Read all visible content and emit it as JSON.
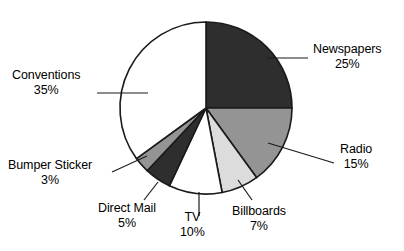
{
  "chart_data": {
    "type": "pie",
    "title": "",
    "subtitle": "",
    "xlabel": "",
    "ylabel": "",
    "legend_position": "none",
    "grid": false,
    "labels_shown": "outside-with-leader-lines",
    "total": 100,
    "units": "%",
    "start_angle_deg": 0,
    "direction": "clockwise",
    "categories": [
      "Newspapers",
      "Radio",
      "Billboards",
      "TV",
      "Direct Mail",
      "Bumper Sticker",
      "Conventions"
    ],
    "values": [
      25,
      15,
      7,
      10,
      5,
      3,
      35
    ],
    "slices": [
      {
        "name": "Newspapers",
        "value": 25,
        "value_label": "25%",
        "color": "#2e2e2e",
        "start_deg": 0,
        "end_deg": 90
      },
      {
        "name": "Radio",
        "value": 15,
        "value_label": "15%",
        "color": "#949494",
        "start_deg": 90,
        "end_deg": 144
      },
      {
        "name": "Billboards",
        "value": 7,
        "value_label": "7%",
        "color": "#dcdcdc",
        "start_deg": 144,
        "end_deg": 169.2
      },
      {
        "name": "TV",
        "value": 10,
        "value_label": "10%",
        "color": "#ffffff",
        "start_deg": 169.2,
        "end_deg": 205.2
      },
      {
        "name": "Direct Mail",
        "value": 5,
        "value_label": "5%",
        "color": "#2e2e2e",
        "start_deg": 205.2,
        "end_deg": 223.2
      },
      {
        "name": "Bumper Sticker",
        "value": 3,
        "value_label": "3%",
        "color": "#949494",
        "start_deg": 223.2,
        "end_deg": 234
      },
      {
        "name": "Conventions",
        "value": 35,
        "value_label": "35%",
        "color": "#ffffff",
        "start_deg": 234,
        "end_deg": 360
      }
    ]
  },
  "colors": {
    "background": "#ffffff",
    "outline": "#1a1a1a",
    "text": "#000000",
    "dark_slice": "#2e2e2e",
    "mid_gray_slice": "#949494",
    "light_gray_slice": "#dcdcdc",
    "white_slice": "#ffffff"
  },
  "labels": {
    "newspapers": {
      "name": "Newspapers",
      "value": "25%"
    },
    "radio": {
      "name": "Radio",
      "value": "15%"
    },
    "billboards": {
      "name": "Billboards",
      "value": "7%"
    },
    "tv": {
      "name": "TV",
      "value": "10%"
    },
    "direct_mail": {
      "name": "Direct Mail",
      "value": "5%"
    },
    "bumper_sticker": {
      "name": "Bumper Sticker",
      "value": "3%"
    },
    "conventions": {
      "name": "Conventions",
      "value": "35%"
    }
  }
}
